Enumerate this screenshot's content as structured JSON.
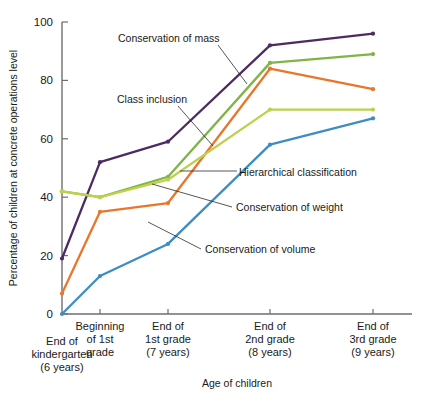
{
  "chart_data": {
    "type": "line",
    "title": "",
    "xlabel": "Age of children",
    "ylabel": "Percentage of children at concrete operations level",
    "ylim": [
      0,
      100
    ],
    "yticks": [
      0,
      20,
      40,
      60,
      80,
      100
    ],
    "grid": false,
    "legend_position": "inline-annotations",
    "categories": [
      "End of kindergarten (6 years)",
      "Beginning of 1st grade",
      "End of 1st grade (7 years)",
      "End of 2nd grade (8 years)",
      "End of 3rd grade (9 years)"
    ],
    "category_lines": [
      [
        "End of",
        "kindergarten",
        "(6 years)"
      ],
      [
        "Beginning",
        "of 1st",
        "grade"
      ],
      [
        "End of",
        "1st grade",
        "(7 years)"
      ],
      [
        "End of",
        "2nd grade",
        "(8 years)"
      ],
      [
        "End of",
        "3rd grade",
        "(9 years)"
      ]
    ],
    "series": [
      {
        "name": "Conservation of mass",
        "color": "#4c2a63",
        "values": [
          19,
          52,
          59,
          92,
          96
        ]
      },
      {
        "name": "Class inclusion",
        "color": "#7fb446",
        "values": [
          42,
          40,
          47,
          86,
          89
        ]
      },
      {
        "name": "Conservation of weight",
        "color": "#e8762c",
        "values": [
          7,
          35,
          38,
          84,
          77
        ]
      },
      {
        "name": "Hierarchical classification",
        "color": "#bdd14a",
        "values": [
          42,
          40,
          46,
          70,
          70
        ]
      },
      {
        "name": "Conservation of volume",
        "color": "#3d8dc4",
        "values": [
          0,
          13,
          24,
          58,
          67
        ]
      }
    ],
    "annotations": [
      {
        "text": "Conservation of mass",
        "x": 118,
        "y": 42
      },
      {
        "text": "Class inclusion",
        "x": 117,
        "y": 103
      },
      {
        "text": "Hierarchical classification",
        "x": 239,
        "y": 176
      },
      {
        "text": "Conservation of weight",
        "x": 236,
        "y": 211
      },
      {
        "text": "Conservation of volume",
        "x": 205,
        "y": 253
      }
    ]
  },
  "axis": {
    "y_tick_labels": [
      "0",
      "20",
      "40",
      "60",
      "80",
      "100"
    ],
    "y_title": "Percentage of children at concrete operations level",
    "x_title": "Age of children"
  }
}
